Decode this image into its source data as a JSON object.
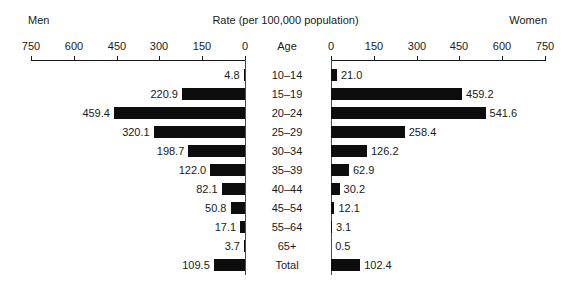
{
  "header": {
    "left_label": "Men",
    "title": "Rate (per 100,000 population)",
    "right_label": "Women",
    "age_column_header": "Age"
  },
  "axes": {
    "left_ticks": [
      "750",
      "600",
      "450",
      "300",
      "150",
      "0"
    ],
    "right_ticks": [
      "0",
      "150",
      "300",
      "450",
      "600",
      "750"
    ]
  },
  "chart_data": {
    "type": "bar",
    "title": "Rate (per 100,000 population)",
    "subtitle": "",
    "orientation": "horizontal-diverging",
    "xlabel": "Rate (per 100,000 population)",
    "ylabel": "Age",
    "xlim": [
      0,
      750
    ],
    "grid": false,
    "legend_position": "outside-top",
    "categories": [
      "10–14",
      "15–19",
      "20–24",
      "25–29",
      "30–34",
      "35–39",
      "40–44",
      "45–54",
      "55–64",
      "65+",
      "Total"
    ],
    "series": [
      {
        "name": "Men",
        "side": "left",
        "values": [
          4.8,
          220.9,
          459.4,
          320.1,
          198.7,
          122.0,
          82.1,
          50.8,
          17.1,
          3.7,
          109.5
        ],
        "labels": [
          "4.8",
          "220.9",
          "459.4",
          "320.1",
          "198.7",
          "122.0",
          "82.1",
          "50.8",
          "17.1",
          "3.7",
          "109.5"
        ]
      },
      {
        "name": "Women",
        "side": "right",
        "values": [
          21.0,
          459.2,
          541.6,
          258.4,
          126.2,
          62.9,
          30.2,
          12.1,
          3.1,
          0.5,
          102.4
        ],
        "labels": [
          "21.0",
          "459.2",
          "541.6",
          "258.4",
          "126.2",
          "62.9",
          "30.2",
          "12.1",
          "3.1",
          "0.5",
          "102.4"
        ]
      }
    ],
    "tick_values": [
      0,
      150,
      300,
      450,
      600,
      750
    ],
    "bar_color": "#0d0d0d"
  }
}
